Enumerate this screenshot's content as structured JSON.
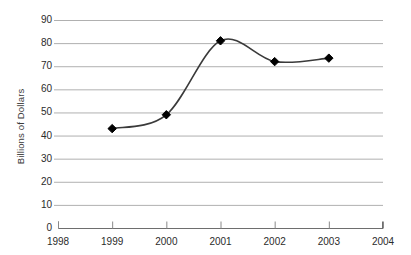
{
  "chart_data": {
    "type": "line",
    "title": "",
    "xlabel": "",
    "ylabel": "Billions of Dollars",
    "x": [
      1999,
      2000,
      2001,
      2002,
      2003
    ],
    "values": [
      43,
      49,
      81,
      72,
      73.5
    ],
    "series": [
      {
        "name": "Billions of Dollars",
        "values": [
          43,
          49,
          81,
          72,
          73.5
        ]
      }
    ],
    "xlim": [
      1998,
      2004
    ],
    "ylim": [
      0,
      90
    ],
    "x_ticks": [
      "1998",
      "1999",
      "2000",
      "2001",
      "2002",
      "2003",
      "2004"
    ],
    "y_ticks": [
      "0",
      "10",
      "20",
      "30",
      "40",
      "50",
      "60",
      "70",
      "80",
      "90"
    ],
    "grid": true,
    "legend": "none",
    "marker": "diamond",
    "line_color": "#3a3a3a",
    "marker_color": "#000000",
    "grid_color": "#b0b0b0",
    "axis_color": "#808080",
    "background": "#ffffff",
    "smoothing": "spline"
  }
}
